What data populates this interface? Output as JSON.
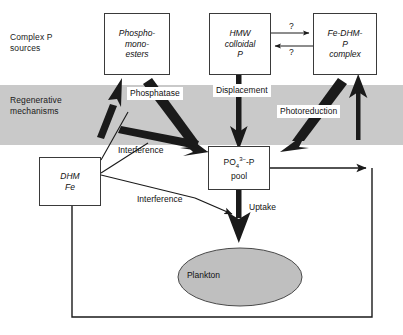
{
  "figure": {
    "type": "flow-diagram"
  },
  "zones": {
    "complex_p": "Complex P\nsources",
    "regenerative": "Regenerative\nmechanisms",
    "band_color": "#c9c9c9"
  },
  "nodes": {
    "phosphomonoesters": "Phospho-\nmono-\nesters",
    "hmw_colloidal": "HMW\ncolloidal\nP",
    "fe_dhm_complex": "Fe-DHM-\nP\ncomplex",
    "dhm_fe": "DHM\nFe",
    "pool_line2": "pool",
    "pool_formula": "PO4 3- -P",
    "plankton": "Plankton"
  },
  "edge_labels": {
    "phosphatase": "Phosphatase",
    "displacement": "Displacement",
    "photoreduction": "Photoreduction",
    "interference_1": "Interference",
    "interference_2": "Interference",
    "uptake": "Uptake",
    "question_top": "?",
    "question_bottom": "?"
  },
  "colors": {
    "band": "#c9c9c9",
    "plankton_fill": "#bfbfbf",
    "stroke": "#1a1a1a",
    "box_border": "#3a3a3a",
    "background": "#ffffff"
  }
}
